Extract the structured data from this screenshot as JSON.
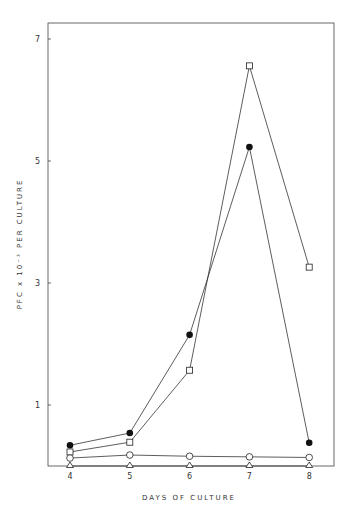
{
  "chart_data": {
    "type": "line",
    "title": "",
    "xlabel": "DAYS  OF  CULTURE",
    "ylabel": "PFC x 10^-3 PER CULTURE",
    "ylabel_display": "PFC x 10⁻³ PER CULTURE",
    "x": [
      4,
      5,
      6,
      7,
      8
    ],
    "xticks": [
      "4",
      "5",
      "6",
      "7",
      "8"
    ],
    "yticks": [
      "1",
      "3",
      "5",
      "7"
    ],
    "ylim": [
      0,
      7.4
    ],
    "grid": false,
    "legend": "none",
    "series": [
      {
        "name": "open square",
        "marker": "square-open",
        "values": [
          0.23,
          0.39,
          1.57,
          6.56,
          3.26
        ]
      },
      {
        "name": "filled circle",
        "marker": "circle-filled",
        "values": [
          0.34,
          0.54,
          2.15,
          5.23,
          0.38
        ]
      },
      {
        "name": "open circle",
        "marker": "circle-open",
        "values": [
          0.13,
          0.18,
          0.16,
          0.15,
          0.14
        ]
      },
      {
        "name": "open triangle",
        "marker": "triangle-open",
        "values": [
          0.0,
          0.0,
          0.0,
          0.0,
          0.0
        ]
      }
    ]
  }
}
